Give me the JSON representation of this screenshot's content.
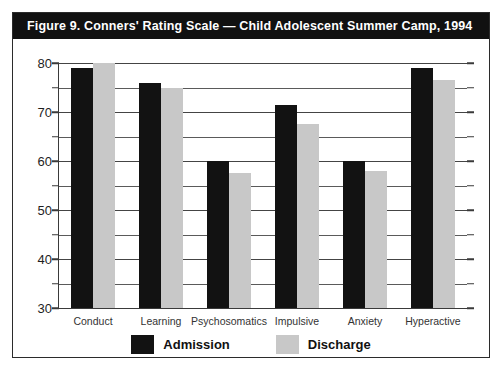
{
  "figure": {
    "title": "Figure 9. Conners' Rating Scale — Child Adolescent Summer Camp, 1994"
  },
  "colors": {
    "admission": "#121212",
    "discharge": "#c8c8c8",
    "title_bar": "#111111",
    "frame": "#2b2b2b",
    "gridline": "#444444"
  },
  "chart_data": {
    "type": "bar",
    "title": "Figure 9. Conners' Rating Scale — Child Adolescent Summer Camp, 1994",
    "xlabel": "",
    "ylabel": "",
    "ylim": [
      30,
      80
    ],
    "ytick_labels": [
      "30",
      "40",
      "50",
      "60",
      "70",
      "80"
    ],
    "ytick_values": [
      30,
      40,
      50,
      60,
      70,
      80
    ],
    "minor_tick_values": [
      35,
      45,
      55,
      65,
      75
    ],
    "grid": true,
    "legend_position": "bottom",
    "categories": [
      "Conduct",
      "Learning",
      "Psychosomatics",
      "Impulsive",
      "Anxiety",
      "Hyperactive"
    ],
    "series": [
      {
        "name": "Admission",
        "color": "#121212",
        "values": [
          79,
          76,
          60,
          71.5,
          60,
          79
        ]
      },
      {
        "name": "Discharge",
        "color": "#c8c8c8",
        "values": [
          80,
          75,
          57.5,
          67.5,
          58,
          76.5
        ]
      }
    ]
  }
}
